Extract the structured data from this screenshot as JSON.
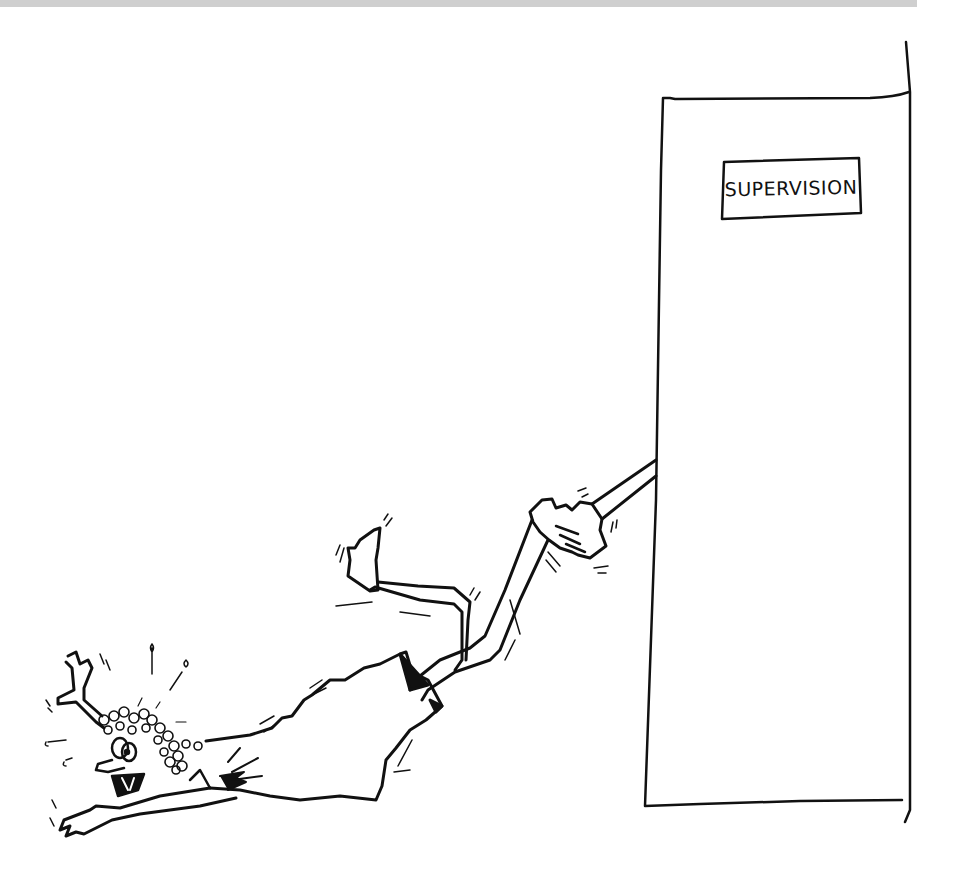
{
  "image": {
    "kind": "cartoon illustration",
    "style": "black ink line drawing on white",
    "colors": {
      "background": "#ffffff",
      "ink": "#111111",
      "top_strip": "#cfcfcf"
    }
  },
  "door": {
    "sign": {
      "text": "SUPERVISION"
    }
  },
  "scene": {
    "description": "A person with curly hair is dragged across the floor by one arm, pulled by a long arm reaching out from a tall door labeled SUPERVISION."
  }
}
